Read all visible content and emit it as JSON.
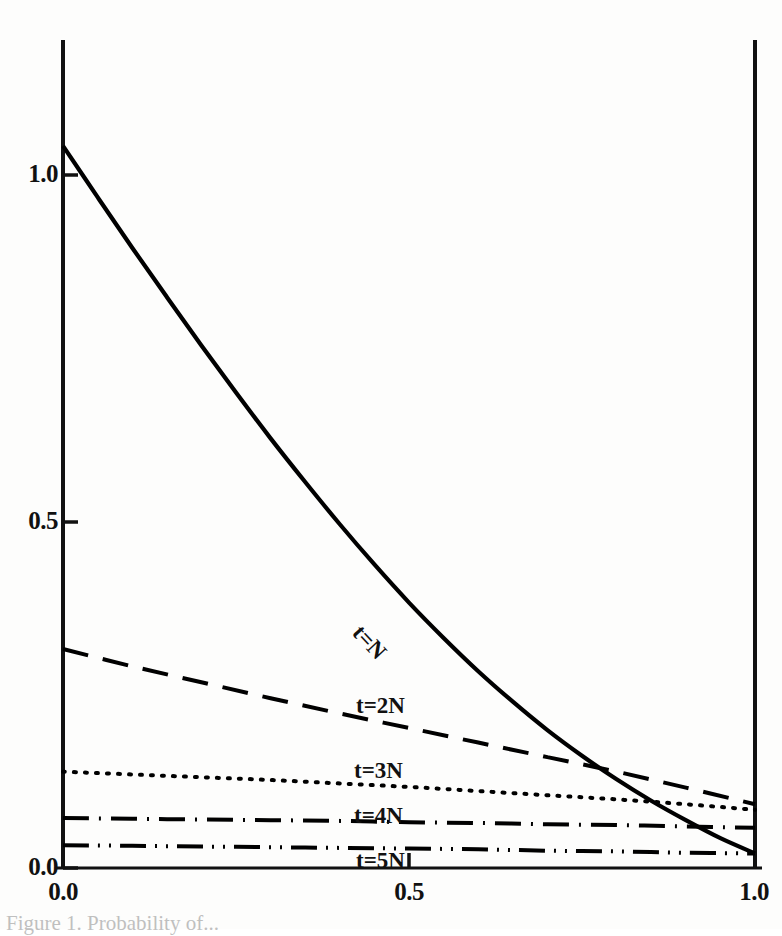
{
  "figure": {
    "background_color": "#fdfdfc",
    "ink_color": "#000000"
  },
  "axes": {
    "x_ticks": [
      "0.0",
      "0.5",
      "1.0"
    ],
    "y_ticks": [
      "0.0",
      "0.5",
      "1.0"
    ],
    "x_axis_label": "",
    "y_axis_label": ""
  },
  "labels": {
    "t_n": "t=N",
    "t_2n": "t=2N",
    "t_3n": "t=3N",
    "t_4n": "t=4N",
    "t_5n": "t=5N"
  },
  "caption": {
    "partial_text": "Figure 1. Probability of..."
  },
  "chart_data": {
    "type": "line",
    "title": "",
    "xlabel": "",
    "ylabel": "",
    "xlim": [
      0.0,
      1.0
    ],
    "ylim": [
      0.0,
      1.2
    ],
    "xticks": [
      0.0,
      0.5,
      1.0
    ],
    "yticks": [
      0.0,
      0.5,
      1.0
    ],
    "grid": false,
    "legend": "inline-curve-labels",
    "series": [
      {
        "name": "t=N",
        "label": "t=N",
        "linestyle": "solid",
        "color": "#000000",
        "linewidth": 4.2,
        "x": [
          0.0,
          0.05,
          0.1,
          0.15,
          0.2,
          0.25,
          0.3,
          0.35,
          0.4,
          0.45,
          0.5,
          0.55,
          0.6,
          0.65,
          0.7,
          0.75,
          0.8,
          0.85,
          0.9,
          0.95,
          1.0
        ],
        "y": [
          1.042,
          0.968,
          0.895,
          0.824,
          0.754,
          0.686,
          0.62,
          0.557,
          0.496,
          0.438,
          0.383,
          0.332,
          0.284,
          0.24,
          0.199,
          0.162,
          0.128,
          0.097,
          0.069,
          0.043,
          0.021
        ]
      },
      {
        "name": "t=2N",
        "label": "t=2N",
        "linestyle": "dashed",
        "color": "#000000",
        "linewidth": 4.0,
        "x": [
          0.0,
          0.1,
          0.2,
          0.3,
          0.4,
          0.5,
          0.6,
          0.7,
          0.8,
          0.9,
          1.0
        ],
        "y": [
          0.316,
          0.291,
          0.268,
          0.245,
          0.223,
          0.202,
          0.181,
          0.16,
          0.139,
          0.116,
          0.092
        ]
      },
      {
        "name": "t=3N",
        "label": "t=3N",
        "linestyle": "dotted",
        "color": "#000000",
        "linewidth": 4.0,
        "x": [
          0.0,
          0.1,
          0.2,
          0.3,
          0.4,
          0.5,
          0.6,
          0.7,
          0.8,
          0.9,
          1.0
        ],
        "y": [
          0.139,
          0.135,
          0.131,
          0.127,
          0.122,
          0.117,
          0.111,
          0.105,
          0.099,
          0.092,
          0.084
        ]
      },
      {
        "name": "t=4N",
        "label": "t=4N",
        "linestyle": "dashdot",
        "color": "#000000",
        "linewidth": 4.0,
        "x": [
          0.0,
          0.1,
          0.2,
          0.3,
          0.4,
          0.5,
          0.6,
          0.7,
          0.8,
          0.9,
          1.0
        ],
        "y": [
          0.072,
          0.071,
          0.07,
          0.069,
          0.068,
          0.066,
          0.065,
          0.063,
          0.062,
          0.06,
          0.058
        ]
      },
      {
        "name": "t=5N",
        "label": "t=5N",
        "linestyle": "dashdotdot",
        "color": "#000000",
        "linewidth": 4.0,
        "x": [
          0.0,
          0.1,
          0.2,
          0.3,
          0.4,
          0.5,
          0.6,
          0.7,
          0.8,
          0.9,
          1.0
        ],
        "y": [
          0.033,
          0.032,
          0.031,
          0.03,
          0.029,
          0.028,
          0.027,
          0.025,
          0.024,
          0.022,
          0.021
        ]
      }
    ]
  }
}
